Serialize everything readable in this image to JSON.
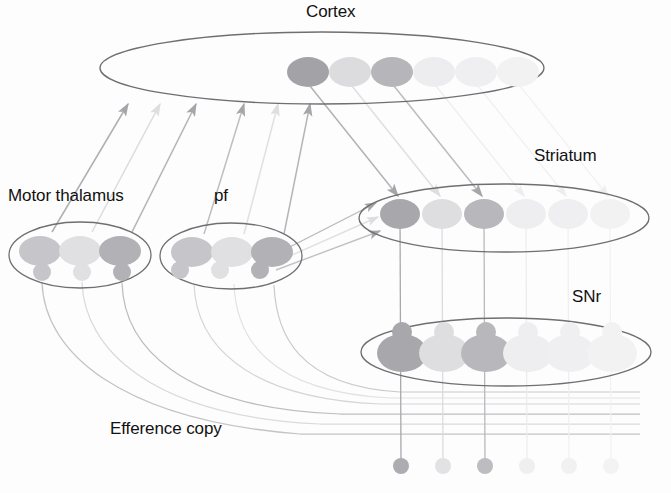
{
  "figure": {
    "domain": "diagram",
    "background_color": "#fdfdfd",
    "width": 671,
    "height": 493
  },
  "labels": {
    "cortex": "Cortex",
    "striatum": "Striatum",
    "motor_thalamus": "Motor thalamus",
    "pf": "pf",
    "snr": "SNr",
    "efference_copy": "Efference copy",
    "bottom_cutoff": "Fun Dromonolocomoloc"
  },
  "colors": {
    "outline": "#6f6f72",
    "text": "#111111",
    "cell_dark": "#9b9b9e",
    "cell_mid": "#c9c9cc",
    "cell_light": "#e2e2e4",
    "cell_faint": "#efeff1",
    "cell_ghost": "#f4f4f5",
    "connector_dark": "#9d9da1",
    "connector_light": "#dcdcde"
  },
  "structures": [
    {
      "name": "cortex",
      "label": "Cortex",
      "ellipse": {
        "cx": 322,
        "cy": 68,
        "rx": 222,
        "ry": 36
      },
      "cell_count": 6,
      "cell_shape": "ellipse",
      "cells": [
        {
          "index": 0,
          "cx": 308,
          "cy": 72,
          "rx": 21,
          "ry": 15,
          "tone": "dark"
        },
        {
          "index": 1,
          "cx": 350,
          "cy": 72,
          "rx": 21,
          "ry": 15,
          "tone": "light"
        },
        {
          "index": 2,
          "cx": 392,
          "cy": 72,
          "rx": 21,
          "ry": 15,
          "tone": "mid"
        },
        {
          "index": 3,
          "cx": 434,
          "cy": 72,
          "rx": 21,
          "ry": 15,
          "tone": "faint"
        },
        {
          "index": 4,
          "cx": 476,
          "cy": 72,
          "rx": 21,
          "ry": 15,
          "tone": "faint"
        },
        {
          "index": 5,
          "cx": 518,
          "cy": 72,
          "rx": 21,
          "ry": 15,
          "tone": "ghost"
        }
      ]
    },
    {
      "name": "striatum",
      "label": "Striatum",
      "ellipse": {
        "cx": 504,
        "cy": 218,
        "rx": 145,
        "ry": 34
      },
      "cell_count": 6,
      "cell_shape": "ellipse",
      "cells": [
        {
          "index": 0,
          "cx": 400,
          "cy": 214,
          "rx": 20,
          "ry": 15,
          "tone": "dark"
        },
        {
          "index": 1,
          "cx": 442,
          "cy": 214,
          "rx": 20,
          "ry": 15,
          "tone": "light"
        },
        {
          "index": 2,
          "cx": 484,
          "cy": 214,
          "rx": 20,
          "ry": 15,
          "tone": "mid"
        },
        {
          "index": 3,
          "cx": 526,
          "cy": 214,
          "rx": 20,
          "ry": 15,
          "tone": "faint"
        },
        {
          "index": 4,
          "cx": 568,
          "cy": 214,
          "rx": 20,
          "ry": 15,
          "tone": "faint"
        },
        {
          "index": 5,
          "cx": 610,
          "cy": 214,
          "rx": 20,
          "ry": 15,
          "tone": "ghost"
        }
      ]
    },
    {
      "name": "snr",
      "label": "SNr",
      "ellipse": {
        "cx": 506,
        "cy": 352,
        "rx": 145,
        "ry": 34
      },
      "cell_count": 6,
      "cell_shape": "soma-with-bouton",
      "cells": [
        {
          "index": 0,
          "cx": 402,
          "cy": 352,
          "rx": 25,
          "ry": 19,
          "tone": "dark"
        },
        {
          "index": 1,
          "cx": 444,
          "cy": 352,
          "rx": 25,
          "ry": 19,
          "tone": "light"
        },
        {
          "index": 2,
          "cx": 486,
          "cy": 352,
          "rx": 25,
          "ry": 19,
          "tone": "mid"
        },
        {
          "index": 3,
          "cx": 528,
          "cy": 352,
          "rx": 25,
          "ry": 19,
          "tone": "faint"
        },
        {
          "index": 4,
          "cx": 570,
          "cy": 352,
          "rx": 25,
          "ry": 19,
          "tone": "faint"
        },
        {
          "index": 5,
          "cx": 612,
          "cy": 352,
          "rx": 25,
          "ry": 19,
          "tone": "ghost"
        }
      ]
    },
    {
      "name": "motor_thalamus",
      "label": "Motor thalamus",
      "ellipse": {
        "cx": 80,
        "cy": 255,
        "rx": 71,
        "ry": 33
      },
      "cell_count": 3,
      "cell_shape": "ellipse-with-bouton",
      "cells": [
        {
          "index": 0,
          "cx": 40,
          "cy": 251,
          "rx": 21,
          "ry": 15,
          "tone": "mid"
        },
        {
          "index": 1,
          "cx": 80,
          "cy": 251,
          "rx": 21,
          "ry": 15,
          "tone": "light"
        },
        {
          "index": 2,
          "cx": 120,
          "cy": 251,
          "rx": 21,
          "ry": 15,
          "tone": "dark"
        }
      ]
    },
    {
      "name": "pf",
      "label": "pf",
      "ellipse": {
        "cx": 231,
        "cy": 256,
        "rx": 71,
        "ry": 33
      },
      "cell_count": 3,
      "cell_shape": "ellipse-with-bouton",
      "cells": [
        {
          "index": 0,
          "cx": 192,
          "cy": 252,
          "rx": 21,
          "ry": 15,
          "tone": "mid"
        },
        {
          "index": 1,
          "cx": 232,
          "cy": 252,
          "rx": 21,
          "ry": 15,
          "tone": "light"
        },
        {
          "index": 2,
          "cx": 272,
          "cy": 252,
          "rx": 21,
          "ry": 15,
          "tone": "dark"
        }
      ]
    },
    {
      "name": "output_terminals",
      "label": "",
      "cell_count": 6,
      "cell_shape": "small-circle",
      "cells": [
        {
          "index": 0,
          "cx": 401,
          "cy": 466,
          "r": 8,
          "tone": "dark"
        },
        {
          "index": 1,
          "cx": 443,
          "cy": 466,
          "r": 8,
          "tone": "light"
        },
        {
          "index": 2,
          "cx": 485,
          "cy": 466,
          "r": 8,
          "tone": "mid"
        },
        {
          "index": 3,
          "cx": 527,
          "cy": 466,
          "r": 8,
          "tone": "faint"
        },
        {
          "index": 4,
          "cx": 569,
          "cy": 466,
          "r": 8,
          "tone": "faint"
        },
        {
          "index": 5,
          "cx": 611,
          "cy": 466,
          "r": 8,
          "tone": "ghost"
        }
      ]
    }
  ],
  "connections": [
    {
      "name": "thalamus-to-cortex",
      "kind": "arrow",
      "count": 6,
      "direction": "up"
    },
    {
      "name": "pf-to-striatum",
      "kind": "arrow",
      "count": 3,
      "direction": "right"
    },
    {
      "name": "cortex-to-striatum",
      "kind": "arrow",
      "count": 6,
      "direction": "down-right"
    },
    {
      "name": "striatum-to-snr",
      "kind": "line",
      "count": 6,
      "direction": "down"
    },
    {
      "name": "snr-to-output",
      "kind": "line",
      "count": 6,
      "direction": "down"
    },
    {
      "name": "efference-copy-curves",
      "kind": "curve",
      "count": 6,
      "direction": "down-right"
    }
  ]
}
